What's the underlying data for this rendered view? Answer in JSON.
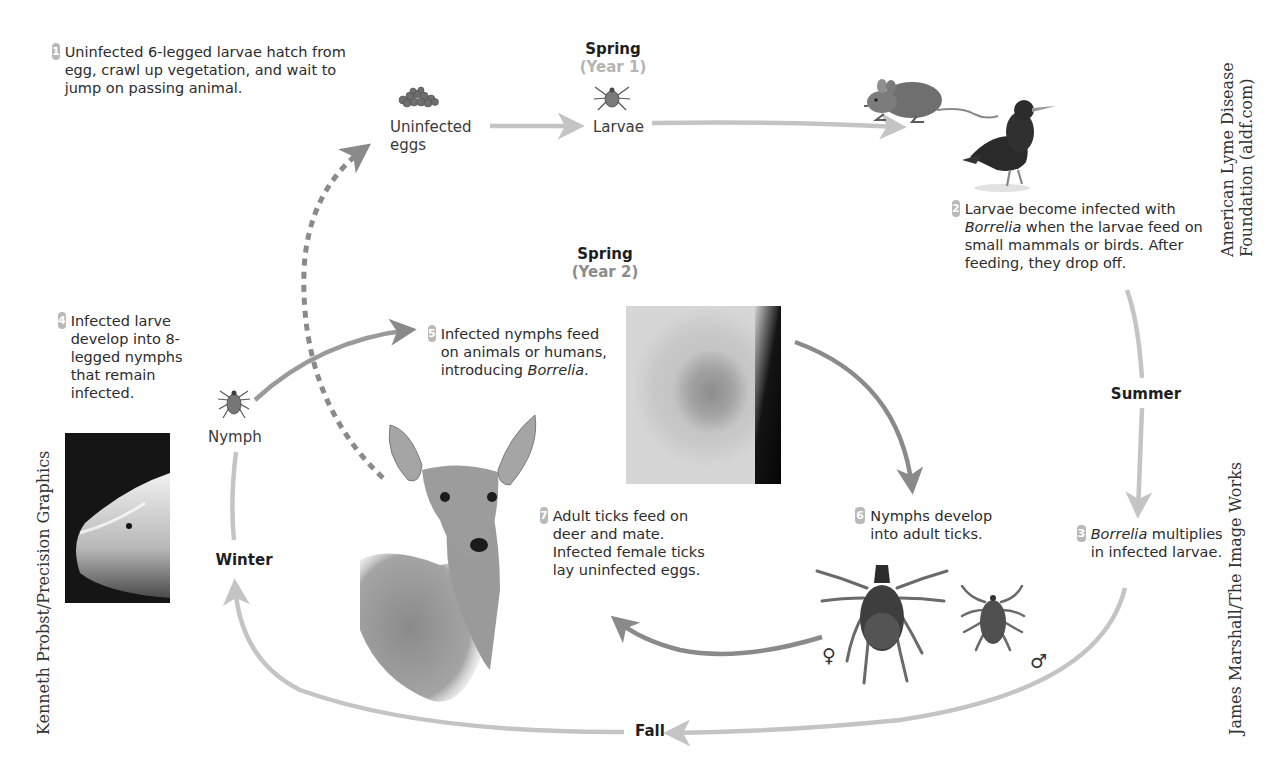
{
  "steps": [
    {
      "num": "1",
      "text": "Uninfected 6-legged larvae hatch from egg, crawl up vegetation, and wait to jump on passing animal."
    },
    {
      "num": "2",
      "text_pre": "Larvae become infected with ",
      "italic": "Borrelia",
      "text_post": " when the larvae feed on small mammals or birds. After feeding, they drop off."
    },
    {
      "num": "3",
      "italic": "Borrelia",
      "text_post": " multiplies in infected larvae."
    },
    {
      "num": "4",
      "text": "Infected larve develop into 8-legged nymphs that remain infected."
    },
    {
      "num": "5",
      "text_pre": "Infected nymphs feed on animals or humans, introducing ",
      "italic": "Borrelia",
      "text_post": "."
    },
    {
      "num": "6",
      "text": "Nymphs develop into adult ticks."
    },
    {
      "num": "7",
      "text": "Adult ticks feed on deer and mate. Infected female ticks lay uninfected eggs."
    }
  ],
  "seasons": {
    "spring1": {
      "label": "Spring",
      "year": "(Year 1)"
    },
    "spring2": {
      "label": "Spring",
      "year": "(Year 2)"
    },
    "summer": "Summer",
    "fall": "Fall",
    "winter": "Winter"
  },
  "stage_labels": {
    "eggs_line1": "Uninfected",
    "eggs_line2": "eggs",
    "larvae": "Larvae",
    "nymph": "Nymph"
  },
  "symbols": {
    "female": "♀",
    "male": "♂"
  },
  "credits": {
    "right_top_line1": "American Lyme Disease",
    "right_top_line2": "Foundation (aldf.com)",
    "right_bottom": "James Marshall/The Image Works",
    "left": "Kenneth Probst/Precision Graphics"
  },
  "colors": {
    "outer_arrow": "#c4c4c4",
    "inner_arrow": "#8a8a8a",
    "badge": "#b9b9b9",
    "year_text": "#b4b4b4"
  },
  "icons": {
    "eggs": "egg-cluster",
    "larva": "six-legged-larva",
    "mouse": "mouse",
    "bird": "bird",
    "nymph": "nymph-tick",
    "deer": "deer",
    "female_tick": "adult-female-tick",
    "male_tick": "adult-male-tick",
    "rash_photo": "bullseye-rash-photo",
    "finger_photo": "tick-on-finger-photo"
  }
}
